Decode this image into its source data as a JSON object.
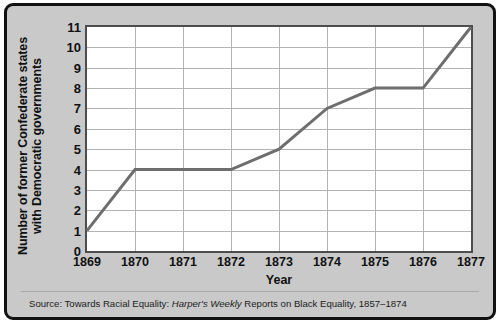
{
  "chart_data": {
    "type": "line",
    "title": "",
    "xlabel": "Year",
    "ylabel": "Number of former Confederate states with Democratic governments",
    "ylabel_lines": [
      "Number of former Confederate states",
      "with Democratic governments"
    ],
    "categories": [
      "1869",
      "1870",
      "1871",
      "1872",
      "1873",
      "1874",
      "1875",
      "1876",
      "1877"
    ],
    "x": [
      1869,
      1870,
      1871,
      1872,
      1873,
      1874,
      1875,
      1876,
      1877
    ],
    "values": [
      1,
      4,
      4,
      4,
      5,
      7,
      8,
      8,
      11
    ],
    "ylim": [
      0,
      11
    ],
    "xlim": [
      1869,
      1877
    ],
    "yticks": [
      0,
      1,
      2,
      3,
      4,
      5,
      6,
      7,
      8,
      9,
      10,
      11
    ],
    "ytick_labels": [
      "0",
      "1",
      "2",
      "3",
      "4",
      "5",
      "6",
      "7",
      "8",
      "9",
      "10",
      "11"
    ],
    "grid": true,
    "legend": "none",
    "series_color": "#6e6e6e",
    "gridline_color": "#b3b3b3",
    "axis_color": "#4d4d4d",
    "plot_background": "#ffffff",
    "figure_background": "#c9c9c9",
    "frame_color": "#111111"
  },
  "source": {
    "prefix": "Source: Towards Racial Equality: ",
    "italic": "Harper's Weekly",
    "suffix": " Reports on Black Equality, 1857–1874",
    "full": "Source: Towards Racial Equality: Harper's Weekly Reports on Black Equality, 1857–1874"
  }
}
